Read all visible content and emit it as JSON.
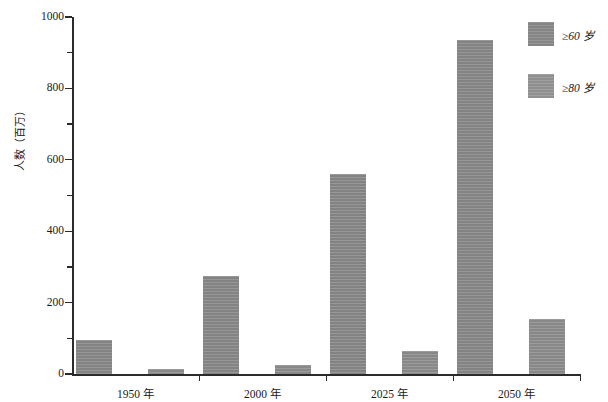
{
  "chart_data": {
    "type": "bar",
    "title": "",
    "xlabel": "",
    "ylabel": "人数（百万）",
    "categories": [
      "1950 年",
      "2000 年",
      "2025 年",
      "2050 年"
    ],
    "series": [
      {
        "name": "≥60 岁",
        "color": "#8a8a8a",
        "values": [
          95,
          275,
          560,
          935
        ]
      },
      {
        "name": "≥80 岁",
        "color": "#8f8f8f",
        "values": [
          13,
          25,
          65,
          155
        ]
      }
    ],
    "ylim": [
      0,
      1000
    ],
    "ytick_labels": [
      "0",
      "200",
      "400",
      "600",
      "800",
      "1000"
    ],
    "ytick_values": [
      0,
      200,
      400,
      600,
      800,
      1000
    ],
    "yminor_values": [
      100,
      300,
      500,
      700,
      900
    ],
    "grid": false,
    "legend_position": "right-top"
  },
  "legend": {
    "items": [
      {
        "label": "≥60 岁",
        "swatch": "legend-swatch-60"
      },
      {
        "label": "≥80 岁",
        "swatch": "legend-swatch-80"
      }
    ]
  }
}
